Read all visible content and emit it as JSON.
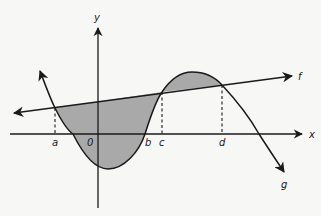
{
  "diagram": {
    "type": "area-between-curves",
    "labels": {
      "x_axis": "x",
      "y_axis": "y",
      "origin": "0",
      "line": "f",
      "curve": "g",
      "a": "a",
      "b": "b",
      "c": "c",
      "d": "d"
    },
    "colors": {
      "stroke": "#1a1a1a",
      "shading": "#a9a9a9",
      "background": "#f7f7f5"
    }
  }
}
